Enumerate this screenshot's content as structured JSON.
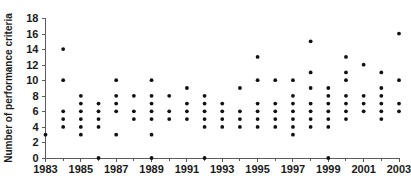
{
  "chart_data": {
    "type": "scatter",
    "title": "",
    "xlabel": "",
    "ylabel": "Number of performance criteria",
    "xlim": [
      1983,
      2003
    ],
    "ylim": [
      0,
      18
    ],
    "grid": false,
    "legend": null,
    "xticks": [
      "1983",
      "1985",
      "1987",
      "1989",
      "1991",
      "1993",
      "1995",
      "1997",
      "1999",
      "2001",
      "2003"
    ],
    "yticks": [
      "0",
      "2",
      "4",
      "6",
      "8",
      "10",
      "12",
      "14",
      "16",
      "18"
    ],
    "marker": "filled-circle",
    "marker_color": "#111111",
    "points_by_year": [
      {
        "x": 1983,
        "values": [
          3
        ]
      },
      {
        "x": 1984,
        "values": [
          4,
          5,
          6,
          10,
          14
        ]
      },
      {
        "x": 1985,
        "values": [
          3,
          4,
          5,
          6,
          7,
          8
        ]
      },
      {
        "x": 1986,
        "values": [
          0,
          4,
          5,
          6,
          7
        ]
      },
      {
        "x": 1987,
        "values": [
          3,
          6,
          7,
          8,
          10
        ]
      },
      {
        "x": 1988,
        "values": [
          5,
          6,
          8
        ]
      },
      {
        "x": 1989,
        "values": [
          0,
          3,
          5,
          6,
          7,
          8,
          10
        ]
      },
      {
        "x": 1990,
        "values": [
          5,
          6,
          8
        ]
      },
      {
        "x": 1991,
        "values": [
          5,
          6,
          7,
          9
        ]
      },
      {
        "x": 1992,
        "values": [
          0,
          4,
          5,
          6,
          7,
          8
        ]
      },
      {
        "x": 1993,
        "values": [
          4,
          5,
          6,
          7
        ]
      },
      {
        "x": 1994,
        "values": [
          4,
          5,
          6,
          9
        ]
      },
      {
        "x": 1995,
        "values": [
          4,
          5,
          6,
          7,
          10,
          13
        ]
      },
      {
        "x": 1996,
        "values": [
          4,
          5,
          6,
          7,
          10
        ]
      },
      {
        "x": 1997,
        "values": [
          3,
          4,
          5,
          6,
          7,
          8,
          10
        ]
      },
      {
        "x": 1998,
        "values": [
          4,
          5,
          6,
          7,
          9,
          11,
          15
        ]
      },
      {
        "x": 1999,
        "values": [
          0,
          4,
          5,
          6,
          7,
          8,
          9
        ]
      },
      {
        "x": 2000,
        "values": [
          5,
          6,
          7,
          8,
          10,
          11,
          13
        ]
      },
      {
        "x": 2001,
        "values": [
          6,
          7,
          8,
          12
        ]
      },
      {
        "x": 2002,
        "values": [
          5,
          6,
          7,
          8,
          9,
          11
        ]
      },
      {
        "x": 2003,
        "values": [
          6,
          7,
          10,
          16
        ]
      }
    ]
  },
  "axes": {
    "y_title": "Number of performance criteria"
  }
}
